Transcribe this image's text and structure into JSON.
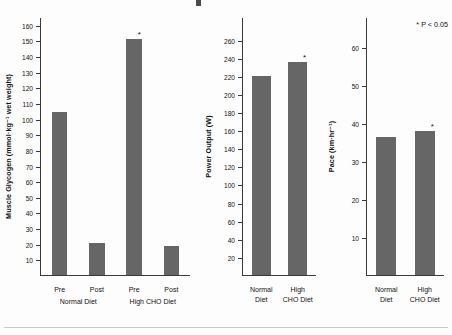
{
  "figure": {
    "significance_note": "* P < 0.05",
    "bar_color": "#666666",
    "axis_color": "#3a3a3a",
    "background": "#fdfdfd"
  },
  "chart_data": [
    {
      "type": "bar",
      "panel": "left",
      "title": "",
      "xlabel": "",
      "ylabel": "Muscle Glycogen (mmol·kg⁻¹ wet weight)",
      "ylim": [
        0,
        165
      ],
      "yticks": [
        160,
        150,
        140,
        130,
        120,
        110,
        100,
        90,
        80,
        70,
        60,
        50,
        40,
        30,
        20,
        10
      ],
      "categories": [
        "Pre",
        "Post",
        "Pre",
        "Post"
      ],
      "groups": [
        "Normal Diet",
        "High CHO Diet"
      ],
      "values": [
        104,
        20.5,
        151,
        18.5
      ],
      "significant": [
        false,
        false,
        true,
        false
      ],
      "grid": false,
      "legend": "none"
    },
    {
      "type": "bar",
      "panel": "middle",
      "title": "",
      "xlabel": "",
      "ylabel": "Power Output (W)",
      "ylim": [
        0,
        285
      ],
      "yticks": [
        260,
        240,
        220,
        200,
        180,
        160,
        140,
        120,
        100,
        80,
        60,
        40,
        20
      ],
      "categories": [
        "Normal Diet",
        "High CHO Diet"
      ],
      "values": [
        220,
        235
      ],
      "significant": [
        false,
        true
      ],
      "grid": false,
      "legend": "none"
    },
    {
      "type": "bar",
      "panel": "right",
      "title": "",
      "xlabel": "",
      "ylabel": "Pace (km·hr⁻¹)",
      "ylim": [
        0,
        68
      ],
      "yticks": [
        60,
        50,
        40,
        30,
        20,
        10
      ],
      "categories": [
        "Normal Diet",
        "High CHO Diet"
      ],
      "values": [
        36.5,
        38
      ],
      "significant": [
        false,
        true
      ],
      "grid": false,
      "legend": "none"
    }
  ],
  "panels": {
    "glycogen": {
      "ylabel": "Muscle Glycogen (mmol·kg⁻¹ wet weight)",
      "yticks": [
        "160",
        "150",
        "140",
        "130",
        "120",
        "110",
        "100",
        "90",
        "80",
        "70",
        "60",
        "50",
        "40",
        "30",
        "20",
        "10"
      ],
      "bars": [
        {
          "label": "Pre",
          "value": 104,
          "star": ""
        },
        {
          "label": "Post",
          "value": 20.5,
          "star": ""
        },
        {
          "label": "Pre",
          "value": 151,
          "star": "*"
        },
        {
          "label": "Post",
          "value": 18.5,
          "star": ""
        }
      ],
      "groups": [
        "Normal Diet",
        "High CHO Diet"
      ]
    },
    "power": {
      "ylabel": "Power Output (W)",
      "yticks": [
        "260",
        "240",
        "220",
        "200",
        "180",
        "160",
        "140",
        "120",
        "100",
        "80",
        "60",
        "40",
        "20"
      ],
      "bars": [
        {
          "label_line1": "Normal",
          "label_line2": "Diet",
          "value": 220,
          "star": ""
        },
        {
          "label_line1": "High",
          "label_line2": "CHO Diet",
          "value": 235,
          "star": "*"
        }
      ]
    },
    "pace": {
      "ylabel": "Pace (km·hr⁻¹)",
      "yticks": [
        "60",
        "50",
        "40",
        "30",
        "20",
        "10"
      ],
      "bars": [
        {
          "label_line1": "Normal",
          "label_line2": "Diet",
          "value": 36.5,
          "star": ""
        },
        {
          "label_line1": "High",
          "label_line2": "CHO Diet",
          "value": 38,
          "star": "*"
        }
      ]
    }
  }
}
